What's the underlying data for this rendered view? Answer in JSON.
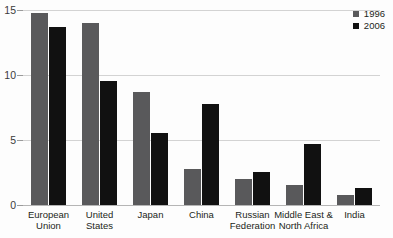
{
  "chart_data": {
    "type": "bar",
    "title": "",
    "xlabel": "",
    "ylabel": "",
    "ylim": [
      0,
      15
    ],
    "yticks": [
      0,
      5,
      10,
      15
    ],
    "ytick_labels": [
      "0",
      "5",
      "10",
      "15"
    ],
    "grid": true,
    "legend_position": "top-right",
    "categories": [
      "European\nUnion",
      "United\nStates",
      "Japan",
      "China",
      "Russian\nFederation",
      "Middle East &\nNorth Africa",
      "India"
    ],
    "series": [
      {
        "name": "1996",
        "color": "#59595b",
        "values": [
          14.8,
          14.0,
          8.7,
          2.8,
          2.0,
          1.5,
          0.8
        ]
      },
      {
        "name": "2006",
        "color": "#111111",
        "values": [
          13.7,
          9.5,
          5.5,
          7.8,
          2.5,
          4.7,
          1.3
        ]
      }
    ]
  },
  "legend": {
    "items": [
      {
        "label": "1996",
        "color": "#59595b"
      },
      {
        "label": "2006",
        "color": "#111111"
      }
    ]
  },
  "axis": {
    "y_labels": [
      "15",
      "10",
      "5",
      "0"
    ]
  }
}
